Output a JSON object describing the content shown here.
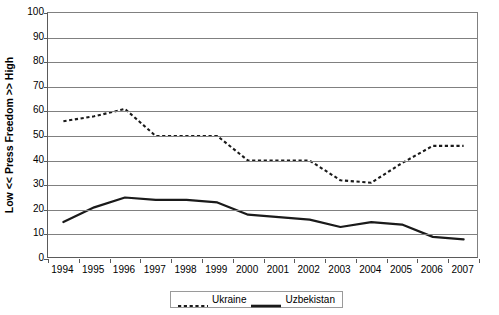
{
  "chart_data": {
    "type": "line",
    "title": "",
    "xlabel": "",
    "ylabel": "Low << Press Freedom >> High",
    "categories": [
      "1994",
      "1995",
      "1996",
      "1997",
      "1998",
      "1999",
      "2000",
      "2001",
      "2002",
      "2003",
      "2004",
      "2005",
      "2006",
      "2007"
    ],
    "ylim": [
      0,
      100
    ],
    "y_ticks": [
      0,
      10,
      20,
      30,
      40,
      50,
      60,
      70,
      80,
      90,
      100
    ],
    "grid": true,
    "legend_position": "bottom-center",
    "series": [
      {
        "name": "Ukraine",
        "style": "dashed",
        "color": "#1a1a1a",
        "values": [
          56,
          58,
          61,
          50,
          50,
          50,
          40,
          40,
          40,
          32,
          31,
          39,
          46,
          46
        ]
      },
      {
        "name": "Uzbekistan",
        "style": "solid",
        "color": "#1a1a1a",
        "values": [
          15,
          21,
          25,
          24,
          24,
          23,
          18,
          17,
          16,
          13,
          15,
          14,
          9,
          8
        ]
      }
    ]
  },
  "axes": {
    "y_title": "Low << Press Freedom >> High",
    "y_tick_labels": [
      "100",
      "90",
      "80",
      "70",
      "60",
      "50",
      "40",
      "30",
      "20",
      "10",
      "0"
    ],
    "x_tick_labels": [
      "1994",
      "1995",
      "1996",
      "1997",
      "1998",
      "1999",
      "2000",
      "2001",
      "2002",
      "2003",
      "2004",
      "2005",
      "2006",
      "2007"
    ]
  },
  "legend": {
    "items": [
      {
        "label": "Ukraine",
        "style": "dashed"
      },
      {
        "label": "Uzbekistan",
        "style": "solid"
      }
    ]
  },
  "colors": {
    "series_line": "#1a1a1a",
    "gridline": "#808080",
    "axis": "#5a5a5a",
    "background": "#ffffff",
    "legend_border": "#9a9a9a"
  }
}
